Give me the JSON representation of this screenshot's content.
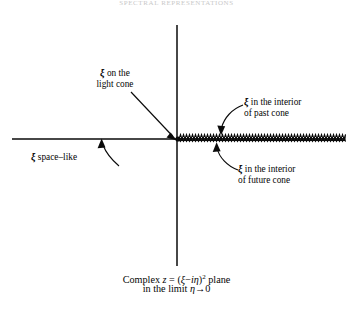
{
  "figure": {
    "header_partial": "SPECTRAL REPRESENTATIONS",
    "labels": {
      "light_cone": {
        "xi": "ξ",
        "line1": " on the",
        "line2": "light cone"
      },
      "past_cone": {
        "xi": "ξ",
        "line1": " in the interior",
        "line2": "of past cone"
      },
      "future_cone": {
        "xi": "ξ",
        "line1": " in the interior",
        "line2": "of future cone"
      },
      "space_like": {
        "xi": "ξ",
        "text": " space–like"
      }
    },
    "caption": {
      "line1_a": "Complex ",
      "line1_z": "z",
      "line1_b": " = (",
      "line1_xi": "ξ",
      "line1_c": "−",
      "line1_i": "i",
      "line1_eta": "η",
      "line1_d": ")",
      "line1_sup": "2",
      "line1_e": " plane",
      "line2_a": "in the limit ",
      "line2_eta": "η",
      "line2_b": "→0"
    },
    "axes": {
      "origin_x": 177,
      "origin_y": 139,
      "vertical_top": 25,
      "vertical_bottom": 266,
      "horizontal_left": 12,
      "horizontal_right": 345,
      "line_color": "#0a0a0a",
      "line_width": 1.4
    },
    "branch_cut": {
      "description": "zigzag-hatched branch cut along positive real axis",
      "start_x": 179,
      "end_x": 345,
      "y": 139,
      "tooth_width": 3.0,
      "tooth_height": 4.6,
      "color": "#0a0a0a"
    }
  }
}
